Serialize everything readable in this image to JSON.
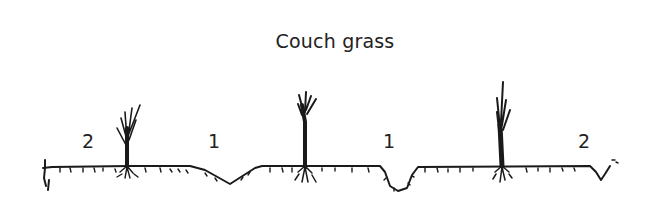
{
  "diagram": {
    "title": "Couch grass",
    "zone_labels": [
      {
        "text": "2",
        "x": 82,
        "y": 130
      },
      {
        "text": "1",
        "x": 208,
        "y": 130
      },
      {
        "text": "1",
        "x": 383,
        "y": 130
      },
      {
        "text": "2",
        "x": 578,
        "y": 130
      }
    ],
    "plants": [
      {
        "name": "couch-grass-plant-1",
        "x": 127
      },
      {
        "name": "couch-grass-plant-2",
        "x": 305
      },
      {
        "name": "couch-grass-plant-3",
        "x": 502
      }
    ],
    "stroke_color": "#1a1a1a"
  }
}
